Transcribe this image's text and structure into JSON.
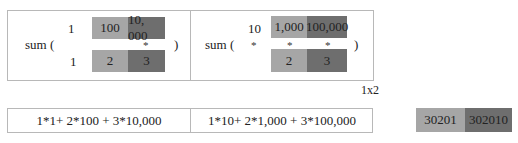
{
  "colors": {
    "light_cell": "#a6a6a6",
    "dark_cell": "#6e6e6e",
    "border": "#b8b8b8"
  },
  "left_panel": {
    "sum_label": "sum (",
    "close_paren": ")",
    "row1_scalar": "1",
    "row1_cells": [
      "100",
      "10, 000"
    ],
    "star": "*",
    "row2_scalar": "1",
    "row2_cells": [
      "2",
      "3"
    ]
  },
  "right_panel": {
    "sum_label": "sum (",
    "close_paren": ")",
    "row1_cells": [
      "10",
      "1,000",
      "100,000"
    ],
    "stars": [
      "*",
      "*",
      "*"
    ],
    "row2_cells": [
      "2",
      "3"
    ]
  },
  "shape_label": "1x2",
  "formulas": [
    "1*1+ 2*100 + 3*10,000",
    "1*10+ 2*1,000 + 3*100,000"
  ],
  "results": [
    "30201",
    "302010"
  ]
}
